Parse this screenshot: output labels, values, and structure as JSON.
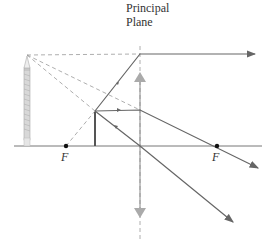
{
  "diagram": {
    "type": "ray-diagram-converging-lens-virtual-image",
    "plane_label_line1": "Principal",
    "plane_label_line2": "Plane",
    "focal_left_label": "F",
    "focal_right_label": "F",
    "colors": {
      "ray": "#666666",
      "virtual_ray": "#999999",
      "axis": "#777777",
      "lens_arrow": "#aaaaaa",
      "object": "#555555",
      "focal_point": "#111111",
      "text": "#333333"
    },
    "elements": {
      "optical_axis": "horizontal line",
      "lens": "thin converging lens with arrowheads",
      "object": "short upright arrow inside focal length",
      "image": "enlarged virtual upright pencil image",
      "rays": [
        "parallel ray refracted through right F",
        "ray toward left F direction refracted parallel",
        "central ray undeviated"
      ]
    }
  }
}
